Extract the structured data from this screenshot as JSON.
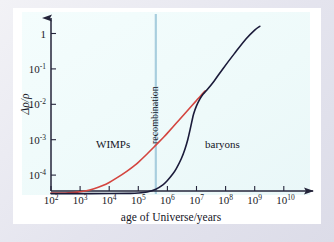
{
  "figure": {
    "name": "density-contrast-vs-age-of-universe",
    "background_color": "#e6e6f0",
    "plot_background_color": "#f0fbfb",
    "frame_color": "#ffffff"
  },
  "chart_data": {
    "type": "line",
    "title": "",
    "xlabel": "age of Universe/years",
    "ylabel": "Δρ/ρ",
    "xscale": "log",
    "yscale": "log",
    "xlim": [
      100,
      10000000000
    ],
    "ylim": [
      2e-05,
      3
    ],
    "grid": false,
    "legend": "inline-annotations",
    "xticks": [
      {
        "value": 100,
        "label": "10",
        "exponent": "2"
      },
      {
        "value": 1000,
        "label": "10",
        "exponent": "3"
      },
      {
        "value": 10000,
        "label": "10",
        "exponent": "4"
      },
      {
        "value": 100000,
        "label": "10",
        "exponent": "5"
      },
      {
        "value": 1000000,
        "label": "10",
        "exponent": "6"
      },
      {
        "value": 10000000,
        "label": "10",
        "exponent": "7"
      },
      {
        "value": 100000000,
        "label": "10",
        "exponent": "8"
      },
      {
        "value": 1000000000,
        "label": "10",
        "exponent": "9"
      },
      {
        "value": 10000000000,
        "label": "10",
        "exponent": "10"
      }
    ],
    "yticks": [
      {
        "value": 1,
        "label": "1",
        "exponent": ""
      },
      {
        "value": 0.1,
        "label": "10",
        "exponent": "-1"
      },
      {
        "value": 0.01,
        "label": "10",
        "exponent": "-2"
      },
      {
        "value": 0.001,
        "label": "10",
        "exponent": "-3"
      },
      {
        "value": 0.0001,
        "label": "10",
        "exponent": "-4"
      }
    ],
    "series": [
      {
        "name": "WIMPs",
        "label": "WIMPs",
        "color": "#d4453f",
        "points": [
          [
            100,
            3.1e-05
          ],
          [
            200,
            3.1e-05
          ],
          [
            400,
            3.15e-05
          ],
          [
            800,
            3.3e-05
          ],
          [
            1500,
            3.55e-05
          ],
          [
            3000,
            4.1e-05
          ],
          [
            6000,
            5.05e-05
          ],
          [
            10000,
            6.2e-05
          ],
          [
            20000,
            8.75e-05
          ],
          [
            40000,
            0.000128
          ],
          [
            70000,
            0.00018
          ],
          [
            100000,
            0.00023
          ],
          [
            200000,
            0.000395
          ],
          [
            400000,
            0.0007
          ],
          [
            700000,
            0.00112
          ],
          [
            1000000,
            0.00153
          ],
          [
            2000000,
            0.0029
          ],
          [
            4000000,
            0.0055
          ],
          [
            7000000,
            0.0092
          ],
          [
            10000000,
            0.0128
          ],
          [
            14000000,
            0.0175
          ],
          [
            20000000,
            0.024
          ]
        ]
      },
      {
        "name": "baryons",
        "label": "baryons",
        "color": "#1b1b3a",
        "points": [
          [
            100,
            3e-05
          ],
          [
            1000,
            3e-05
          ],
          [
            10000,
            3.01e-05
          ],
          [
            50000,
            3.05e-05
          ],
          [
            100000,
            3.12e-05
          ],
          [
            200000,
            3.35e-05
          ],
          [
            400000,
            4e-05
          ],
          [
            700000,
            5.3e-05
          ],
          [
            1000000,
            7e-05
          ],
          [
            1500000,
            0.000105
          ],
          [
            2000000,
            0.00015
          ],
          [
            3000000,
            0.00029
          ],
          [
            4000000,
            0.00054
          ],
          [
            5000000,
            0.001
          ],
          [
            6000000,
            0.0019
          ],
          [
            7000000,
            0.0034
          ],
          [
            8000000,
            0.0054
          ],
          [
            10000000,
            0.009
          ],
          [
            13000000,
            0.014
          ],
          [
            17000000,
            0.0195
          ],
          [
            22000000,
            0.0245
          ],
          [
            40000000,
            0.045
          ],
          [
            80000000,
            0.1
          ],
          [
            200000000,
            0.27
          ],
          [
            500000000,
            0.7
          ],
          [
            1000000000,
            1.25
          ],
          [
            1500000000,
            1.6
          ]
        ]
      }
    ],
    "annotations": [
      {
        "name": "recombination-line",
        "type": "vline",
        "label": "recombination",
        "value": 400000,
        "color": "#a8cede",
        "orientation": "vertical"
      },
      {
        "name": "wimps-label",
        "type": "text",
        "label": "WIMPs",
        "x": 30000,
        "y": 0.00052
      },
      {
        "name": "baryons-label",
        "type": "text",
        "label": "baryons",
        "x": 13000000,
        "y": 0.00052
      }
    ]
  }
}
